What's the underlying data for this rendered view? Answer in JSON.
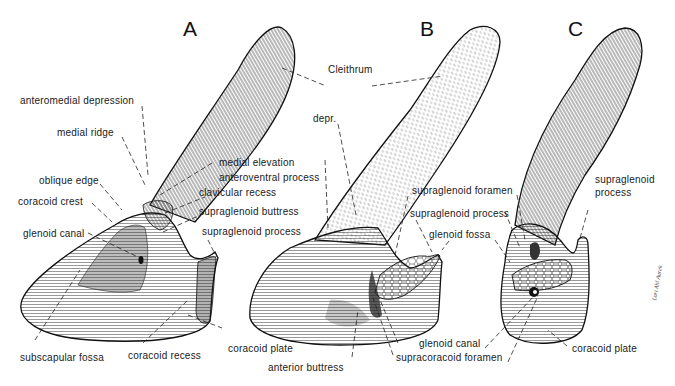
{
  "figure": {
    "panels": [
      {
        "id": "A",
        "letter": "A"
      },
      {
        "id": "B",
        "letter": "B"
      },
      {
        "id": "C",
        "letter": "C"
      }
    ],
    "shared_label": "Cleithrum",
    "labels": {
      "A": {
        "anteromedial_depression": "anteromedial depression",
        "medial_ridge": "medial ridge",
        "oblique_edge": "oblique edge",
        "coracoid_crest": "coracoid crest",
        "glenoid_canal": "glenoid canal",
        "medial_elevation": "medial elevation",
        "anteroventral_process": "anteroventral process",
        "clavicular_recess": "clavicular recess",
        "supraglenoid_buttress": "supraglenoid buttress",
        "supraglenoid_process": "supraglenoid process",
        "subscapular_fossa": "subscapular fossa",
        "coracoid_recess": "coracoid recess",
        "coracoid_plate": "coracoid plate"
      },
      "B": {
        "depr": "depr.",
        "supraglenoid_foramen": "supraglenoid foramen",
        "supraglenoid_process": "supraglenoid process",
        "glenoid_fossa": "glenoid fossa",
        "glenoid_canal": "glenoid canal",
        "supracoracoid_foramen": "supracoracoid foramen",
        "anterior_buttress": "anterior buttress"
      },
      "C": {
        "supraglenoid_process_line1": "supraglenoid",
        "supraglenoid_process_line2": "process",
        "coracoid_plate": "coracoid plate"
      }
    },
    "signature": "Lori Ahl Aurek"
  }
}
